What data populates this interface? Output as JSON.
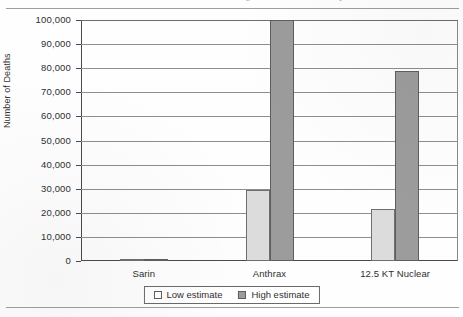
{
  "page": {
    "cut_off_header": "Aerosol Release of Chemical, Biological, and Nuclear Weapons"
  },
  "chart_data": {
    "type": "bar",
    "title": "",
    "xlabel": "",
    "ylabel": "Number of Deaths",
    "categories": [
      "Sarin",
      "Anthrax",
      "12.5 KT Nuclear"
    ],
    "series": [
      {
        "name": "Low estimate",
        "color": "#dcdcdc",
        "values": [
          100,
          29500,
          21500
        ]
      },
      {
        "name": "High estimate",
        "color": "#9c9c9c",
        "values": [
          800,
          100000,
          79000
        ]
      }
    ],
    "ylim": [
      0,
      100000
    ],
    "ytick_values": [
      0,
      10000,
      20000,
      30000,
      40000,
      50000,
      60000,
      70000,
      80000,
      90000,
      100000
    ],
    "ytick_labels": [
      "0",
      "10,000",
      "20,000",
      "30,000",
      "40,000",
      "50,000",
      "60,000",
      "70,000",
      "80,000",
      "90,000",
      "100,000"
    ],
    "grid": true,
    "legend_position": "bottom"
  }
}
